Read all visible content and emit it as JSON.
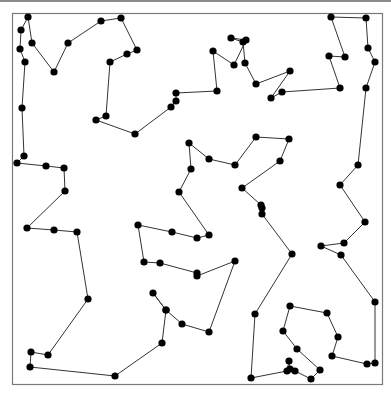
{
  "diagram": {
    "type": "tour-path",
    "frame": {
      "x": 12,
      "y": 13,
      "width": 370,
      "height": 371,
      "stroke": "#7a7a7a"
    },
    "style": {
      "line_color": "#333333",
      "line_width": 1,
      "node_color": "#000000",
      "node_radius": 3.6,
      "top_bar_color": "#8a8a8a"
    },
    "closed": true,
    "points": [
      [
        28,
        17
      ],
      [
        32,
        43
      ],
      [
        54,
        72
      ],
      [
        68,
        43
      ],
      [
        101,
        21
      ],
      [
        121,
        18
      ],
      [
        137,
        50
      ],
      [
        127,
        54
      ],
      [
        110,
        62
      ],
      [
        106,
        116
      ],
      [
        96,
        120
      ],
      [
        135,
        134
      ],
      [
        171,
        107
      ],
      [
        176,
        101
      ],
      [
        176,
        93
      ],
      [
        217,
        91
      ],
      [
        213,
        51
      ],
      [
        234,
        65
      ],
      [
        246,
        40
      ],
      [
        231,
        38
      ],
      [
        243,
        42
      ],
      [
        245,
        63
      ],
      [
        256,
        84
      ],
      [
        290,
        71
      ],
      [
        271,
        98
      ],
      [
        282,
        92
      ],
      [
        340,
        88
      ],
      [
        329,
        56
      ],
      [
        345,
        57
      ],
      [
        331,
        17
      ],
      [
        366,
        18
      ],
      [
        368,
        48
      ],
      [
        375,
        62
      ],
      [
        366,
        88
      ],
      [
        358,
        165
      ],
      [
        340,
        185
      ],
      [
        365,
        222
      ],
      [
        344,
        243
      ],
      [
        321,
        246
      ],
      [
        341,
        255
      ],
      [
        375,
        302
      ],
      [
        375,
        363
      ],
      [
        367,
        364
      ],
      [
        332,
        356
      ],
      [
        338,
        337
      ],
      [
        327,
        313
      ],
      [
        290,
        306
      ],
      [
        283,
        331
      ],
      [
        297,
        349
      ],
      [
        320,
        370
      ],
      [
        311,
        379
      ],
      [
        295,
        371
      ],
      [
        290,
        369
      ],
      [
        289,
        361
      ],
      [
        287,
        371
      ],
      [
        251,
        378
      ],
      [
        255,
        314
      ],
      [
        292,
        254
      ],
      [
        262,
        214
      ],
      [
        262,
        208
      ],
      [
        261,
        205
      ],
      [
        242,
        188
      ],
      [
        280,
        161
      ],
      [
        289,
        139
      ],
      [
        256,
        137
      ],
      [
        235,
        165
      ],
      [
        209,
        159
      ],
      [
        189,
        143
      ],
      [
        191,
        169
      ],
      [
        179,
        192
      ],
      [
        209,
        235
      ],
      [
        197,
        238
      ],
      [
        172,
        232
      ],
      [
        138,
        225
      ],
      [
        144,
        262
      ],
      [
        160,
        263
      ],
      [
        197,
        273
      ],
      [
        197,
        276
      ],
      [
        235,
        261
      ],
      [
        209,
        332
      ],
      [
        182,
        324
      ],
      [
        166,
        310
      ],
      [
        153,
        293
      ],
      [
        166,
        310
      ],
      [
        162,
        343
      ],
      [
        115,
        376
      ],
      [
        30,
        367
      ],
      [
        31,
        352
      ],
      [
        48,
        355
      ],
      [
        88,
        299
      ],
      [
        77,
        232
      ],
      [
        54,
        230
      ],
      [
        27,
        228
      ],
      [
        65,
        191
      ],
      [
        64,
        168
      ],
      [
        46,
        166
      ],
      [
        17,
        163
      ],
      [
        24,
        156
      ],
      [
        22,
        108
      ],
      [
        25,
        62
      ],
      [
        20,
        49
      ],
      [
        21,
        30
      ]
    ]
  }
}
